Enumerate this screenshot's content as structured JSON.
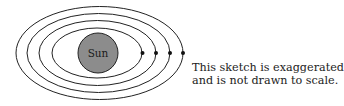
{
  "diagram": {
    "sun_label": "Sun",
    "caption_line1": "This sketch is exaggerated",
    "caption_line2": "and is not drawn to scale.",
    "orbit_count": 4,
    "colors": {
      "sun_fill": "#8c8c8c",
      "stroke": "#222222",
      "background": "#ffffff"
    }
  }
}
